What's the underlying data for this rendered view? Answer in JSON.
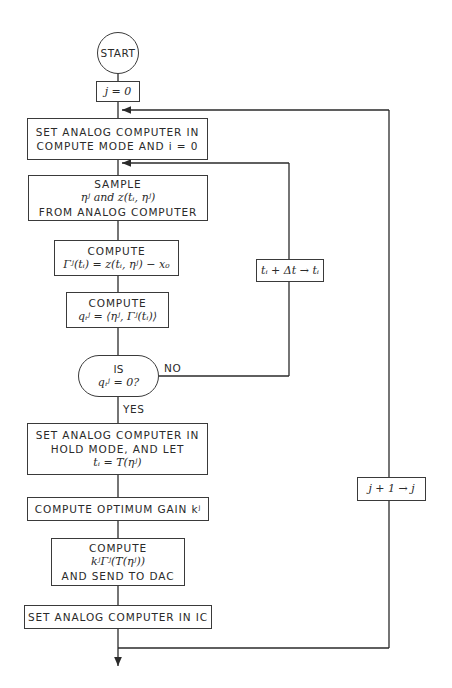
{
  "diagram": {
    "type": "flowchart",
    "start": "START",
    "init_j": "j = 0",
    "set_compute": [
      "SET ANALOG COMPUTER IN",
      "COMPUTE MODE AND i = 0"
    ],
    "sample": [
      "SAMPLE",
      "ηʲ and z(tᵢ, ηʲ)",
      "FROM ANALOG COMPUTER"
    ],
    "compute_gamma": [
      "COMPUTE",
      "Γʲ(tᵢ) = z(tᵢ, ηʲ) − x₀"
    ],
    "compute_q": [
      "COMPUTE",
      "qᵢʲ = ⟨ηʲ, Γʲ(tᵢ)⟩"
    ],
    "decision": [
      "IS",
      "qᵢʲ = 0?"
    ],
    "no_label": "NO",
    "yes_label": "YES",
    "time_step": "tᵢ + Δt → tᵢ",
    "set_hold": [
      "SET ANALOG COMPUTER IN",
      "HOLD MODE, AND LET",
      "tᵢ = T(ηʲ)"
    ],
    "optimum_gain": "COMPUTE OPTIMUM GAIN kʲ",
    "compute_send": [
      "COMPUTE",
      "kʲΓʲ(T(ηʲ))",
      "AND SEND TO DAC"
    ],
    "set_ic": "SET ANALOG COMPUTER IN IC",
    "j_increment": "j + 1 → j"
  }
}
